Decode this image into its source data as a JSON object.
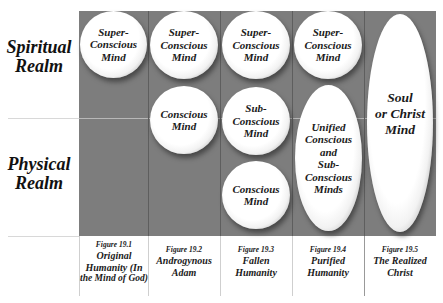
{
  "rows": {
    "spiritual": "Spiritual\nRealm",
    "spiritual_l1": "Spiritual",
    "spiritual_l2": "Realm",
    "physical_l1": "Physical",
    "physical_l2": "Realm"
  },
  "columns": [
    {
      "figure": "Figure 19.1",
      "title_l1": "Original",
      "title_l2": "Humanity (In",
      "title_l3": "the Mind of God)",
      "orbs": [
        {
          "l1": "Super-",
          "l2": "Conscious",
          "l3": "Mind"
        }
      ]
    },
    {
      "figure": "Figure 19.2",
      "title_l1": "Androgynous",
      "title_l2": "Adam",
      "orbs": [
        {
          "l1": "Super-",
          "l2": "Conscious",
          "l3": "Mind"
        },
        {
          "l1": "Conscious",
          "l2": "Mind"
        }
      ]
    },
    {
      "figure": "Figure 19.3",
      "title_l1": "Fallen",
      "title_l2": "Humanity",
      "orbs": [
        {
          "l1": "Super-",
          "l2": "Conscious",
          "l3": "Mind"
        },
        {
          "l1": "Sub-",
          "l2": "Conscious",
          "l3": "Mind"
        },
        {
          "l1": "Conscious",
          "l2": "Mind"
        }
      ]
    },
    {
      "figure": "Figure 19.4",
      "title_l1": "Purified",
      "title_l2": "Humanity",
      "orbs": [
        {
          "l1": "Super-",
          "l2": "Conscious",
          "l3": "Mind"
        },
        {
          "l1": "Unified",
          "l2": "Conscious",
          "l3": "and",
          "l4": "Sub-",
          "l5": "Conscious",
          "l6": "Minds"
        }
      ]
    },
    {
      "figure": "Figure 19.5",
      "title_l1": "The Realized",
      "title_l2": "Christ",
      "orbs": [
        {
          "l1": "Soul",
          "l2": "or Christ",
          "l3": "Mind"
        }
      ]
    }
  ],
  "colors": {
    "panel": "#7d7d7d",
    "orb": "#ffffff",
    "text": "#1a1a1a"
  }
}
